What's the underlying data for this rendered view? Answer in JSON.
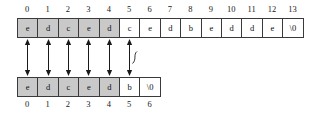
{
  "diagram": {
    "arrays": [
      {
        "name": "top-array",
        "indices": [
          "0",
          "1",
          "2",
          "3",
          "4",
          "5",
          "6",
          "7",
          "8",
          "9",
          "10",
          "11",
          "12",
          "13"
        ],
        "cells": [
          "e",
          "d",
          "c",
          "e",
          "d",
          "c",
          "e",
          "d",
          "b",
          "e",
          "d",
          "d",
          "e",
          "\\0"
        ],
        "shaded": [
          true,
          true,
          true,
          true,
          true,
          false,
          false,
          false,
          false,
          false,
          false,
          false,
          false,
          false
        ],
        "index_position": "above"
      },
      {
        "name": "bottom-array",
        "indices": [
          "0",
          "1",
          "2",
          "3",
          "4",
          "5",
          "6"
        ],
        "cells": [
          "e",
          "d",
          "c",
          "e",
          "d",
          "b",
          "\\0"
        ],
        "shaded": [
          true,
          true,
          true,
          true,
          true,
          false,
          false
        ],
        "index_position": "below"
      }
    ],
    "connectors": [
      {
        "name": "match-arrow-0",
        "column": 0,
        "crossed": false
      },
      {
        "name": "match-arrow-1",
        "column": 1,
        "crossed": false
      },
      {
        "name": "match-arrow-2",
        "column": 2,
        "crossed": false
      },
      {
        "name": "match-arrow-3",
        "column": 3,
        "crossed": false
      },
      {
        "name": "match-arrow-4",
        "column": 4,
        "crossed": false
      },
      {
        "name": "mismatch-arrow-5",
        "column": 5,
        "crossed": true
      }
    ],
    "colors": {
      "shaded_cell": "#c9c9c9",
      "unshaded_cell": "#ffffff",
      "border": "#3a3a3a",
      "text": "#111111",
      "arrow": "#1a1a1a"
    },
    "geometry": {
      "origin_x": 17,
      "cell_width": 20.4,
      "cell_height": 20,
      "top_row_y": 18,
      "bottom_row_y": 77,
      "top_index_y": 4,
      "bottom_index_y": 99
    }
  }
}
